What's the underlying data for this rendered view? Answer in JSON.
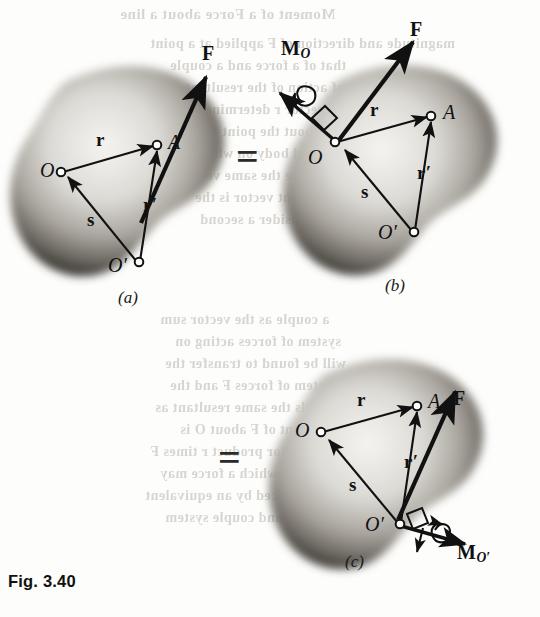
{
  "figure": {
    "caption": "Fig. 3.40",
    "domain_note": "rigid-body moment transfer diagram",
    "equals_sign": "="
  },
  "panels": [
    {
      "id": "a",
      "caption": "(a)",
      "labels": {
        "force": "F",
        "point_O": "O",
        "point_O_prime": "O",
        "point_O_prime_mark": "′",
        "point_A": "A",
        "vector_r": "r",
        "vector_r_prime": "r",
        "vector_r_prime_mark": "′",
        "vector_s": "s"
      }
    },
    {
      "id": "b",
      "caption": "(b)",
      "labels": {
        "force": "F",
        "moment": "M",
        "moment_sub": "O",
        "point_O": "O",
        "point_O_prime": "O",
        "point_O_prime_mark": "′",
        "point_A": "A",
        "vector_r": "r",
        "vector_r_prime": "r",
        "vector_r_prime_mark": "′",
        "vector_s": "s"
      }
    },
    {
      "id": "c",
      "caption": "(c)",
      "labels": {
        "force": "F",
        "moment": "M",
        "moment_sub": "O",
        "moment_sub_mark": "′",
        "point_O": "O",
        "point_O_prime": "O",
        "point_O_prime_mark": "′",
        "point_A": "A",
        "vector_r": "r",
        "vector_r_prime": "r",
        "vector_r_prime_mark": "′",
        "vector_s": "s"
      }
    }
  ],
  "ghost_text": [
    {
      "text": "Moment of a Force about a line",
      "x": 120,
      "y": 6,
      "size": 15
    },
    {
      "text": "magnitude and direction of F applied at a point",
      "x": 150,
      "y": 36,
      "size": 14
    },
    {
      "text": "that of a force and a couple",
      "x": 170,
      "y": 58,
      "size": 14
    },
    {
      "text": "line of action of the resultant",
      "x": 185,
      "y": 80,
      "size": 14
    },
    {
      "text": "radius vector r determines the",
      "x": 175,
      "y": 102,
      "size": 14
    },
    {
      "text": "moment about the point O of",
      "x": 190,
      "y": 124,
      "size": 14
    },
    {
      "text": "of a rigid body on which",
      "x": 195,
      "y": 146,
      "size": 14
    },
    {
      "text": "these are the same vector",
      "x": 180,
      "y": 168,
      "size": 14
    },
    {
      "text": "the moment vector is the",
      "x": 195,
      "y": 190,
      "size": 14
    },
    {
      "text": "we now consider a second",
      "x": 200,
      "y": 212,
      "size": 14
    },
    {
      "text": "a couple as the vector sum",
      "x": 160,
      "y": 312,
      "size": 14
    },
    {
      "text": "system of forces acting on",
      "x": 175,
      "y": 334,
      "size": 14
    },
    {
      "text": "will be found to transfer the",
      "x": 165,
      "y": 356,
      "size": 14
    },
    {
      "text": "system of forces F and the",
      "x": 170,
      "y": 378,
      "size": 14
    },
    {
      "text": "yields the same resultant as",
      "x": 155,
      "y": 400,
      "size": 14
    },
    {
      "text": "moment of F about O is",
      "x": 180,
      "y": 422,
      "size": 14
    },
    {
      "text": "the vector product r times F",
      "x": 150,
      "y": 444,
      "size": 14
    },
    {
      "text": "cases in which a force may",
      "x": 160,
      "y": 466,
      "size": 14
    },
    {
      "text": "be replaced by an equivalent",
      "x": 145,
      "y": 488,
      "size": 14
    },
    {
      "text": "force and couple system",
      "x": 165,
      "y": 510,
      "size": 14
    }
  ]
}
